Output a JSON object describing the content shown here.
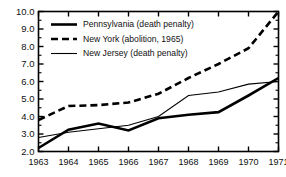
{
  "chart_data": {
    "type": "line",
    "title": "",
    "subtitle": "",
    "xlabel": "",
    "ylabel": "",
    "x": [
      1963,
      1964,
      1965,
      1966,
      1967,
      1968,
      1969,
      1970,
      1971
    ],
    "categories": [
      "1963",
      "1964",
      "1965",
      "1966",
      "1967",
      "1968",
      "1969",
      "1970",
      "1971"
    ],
    "xlim": [
      1963,
      1971
    ],
    "ylim": [
      2.0,
      10.0
    ],
    "ytick_labels": [
      "2.0",
      "3.0",
      "4.0",
      "5.0",
      "6.0",
      "7.0",
      "8.0",
      "9.0",
      "10.0"
    ],
    "ytick_values": [
      2.0,
      3.0,
      4.0,
      5.0,
      6.0,
      7.0,
      8.0,
      9.0,
      10.0
    ],
    "grid": false,
    "legend_position": "upper left",
    "frame": true,
    "series": [
      {
        "name": "Pennsylvania (death penalty)",
        "style": "solid",
        "width": "thick",
        "color": "#000000",
        "values": [
          2.2,
          3.25,
          3.6,
          3.2,
          3.9,
          4.1,
          4.25,
          5.2,
          6.2
        ]
      },
      {
        "name": "New York (abolition, 1965)",
        "style": "dashed",
        "width": "thick",
        "color": "#000000",
        "values": [
          3.8,
          4.6,
          4.65,
          4.8,
          5.3,
          6.2,
          7.0,
          7.9,
          10.0
        ]
      },
      {
        "name": "New Jersey (death penalty)",
        "style": "solid",
        "width": "thin",
        "color": "#000000",
        "values": [
          2.8,
          3.1,
          3.3,
          3.5,
          4.0,
          5.2,
          5.4,
          5.85,
          6.0
        ]
      }
    ]
  },
  "legend": {
    "entries": [
      {
        "label": "Pennsylvania (death penalty)"
      },
      {
        "label": "New York (abolition, 1965)"
      },
      {
        "label": "New Jersey (death penalty)"
      }
    ]
  }
}
